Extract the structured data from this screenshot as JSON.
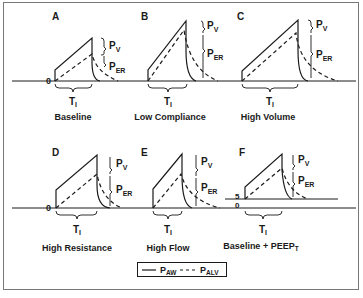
{
  "panels": [
    {
      "letter": "A",
      "caption": "Baseline"
    },
    {
      "letter": "B",
      "caption": "Low Compliance"
    },
    {
      "letter": "C",
      "caption": "High Volume"
    },
    {
      "letter": "D",
      "caption": "High Resistance"
    },
    {
      "letter": "E",
      "caption": "High Flow"
    },
    {
      "letter": "F",
      "caption": "Baseline + PEEP",
      "caption_sub": "T"
    }
  ],
  "labels": {
    "pv": "P",
    "pv_sub": "V",
    "per": "P",
    "per_sub": "ER",
    "ti": "T",
    "ti_sub": "I",
    "zero": "0",
    "peep_value": "5"
  },
  "legend": {
    "solid_label": "P",
    "solid_sub": "AW",
    "dashed_label": "P",
    "dashed_sub": "ALV",
    "solid_meaning": "airway pressure",
    "dashed_meaning": "alveolar pressure"
  },
  "colors": {
    "line": "#1a1a1a",
    "frame": "#777777"
  }
}
